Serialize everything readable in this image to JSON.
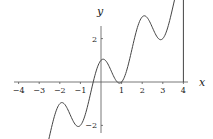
{
  "chart_data": {
    "type": "line",
    "title": "",
    "function": "y = x + cos(pi x)",
    "xlabel": "x",
    "ylabel": "y",
    "xlim": [
      -4,
      4
    ],
    "ylim": [
      -4,
      5
    ],
    "x_ticks": [
      -4,
      -3,
      -2,
      -1,
      1,
      2,
      3,
      4
    ],
    "y_ticks": [
      4,
      2,
      -2,
      -4
    ],
    "x_tick_labels": [
      "−4",
      "−3",
      "−2",
      "−1",
      "1",
      "2",
      "3",
      "4"
    ],
    "y_tick_labels": [
      "4",
      "2",
      "−2",
      "−4"
    ],
    "grid": false,
    "legend": null,
    "series": [
      {
        "name": "f(x)",
        "x": [
          -4,
          -3,
          -2,
          -1,
          0,
          1,
          2,
          3,
          4
        ],
        "values": [
          -3,
          -4,
          -1,
          -2,
          1,
          0,
          3,
          2,
          5
        ]
      }
    ],
    "annotations": [
      "vertical line from (4,0) to (4,5)"
    ],
    "colors": {
      "curve": "#444444",
      "axes": "#555555"
    }
  }
}
